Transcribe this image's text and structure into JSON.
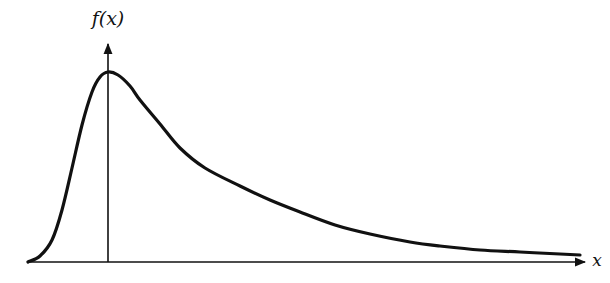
{
  "chart_data": {
    "type": "line",
    "title": "",
    "xlabel": "x",
    "ylabel": "f(x)",
    "grid": false,
    "legend": null,
    "series": [
      {
        "name": "f(x)",
        "points_px": [
          [
            28,
            262
          ],
          [
            40,
            256
          ],
          [
            52,
            240
          ],
          [
            62,
            210
          ],
          [
            72,
            168
          ],
          [
            82,
            125
          ],
          [
            92,
            92
          ],
          [
            100,
            77
          ],
          [
            108,
            72
          ],
          [
            118,
            75
          ],
          [
            130,
            86
          ],
          [
            140,
            100
          ],
          [
            160,
            124
          ],
          [
            180,
            148
          ],
          [
            205,
            168
          ],
          [
            240,
            186
          ],
          [
            270,
            200
          ],
          [
            300,
            212
          ],
          [
            335,
            225
          ],
          [
            370,
            234
          ],
          [
            410,
            242
          ],
          [
            440,
            246
          ],
          [
            480,
            250
          ],
          [
            520,
            252
          ],
          [
            560,
            254
          ],
          [
            580,
            255
          ]
        ]
      }
    ],
    "mode_x_px": 108,
    "axes": {
      "x_axis": {
        "from": [
          28,
          262
        ],
        "to": [
          585,
          262
        ],
        "arrow": true,
        "label": "x"
      },
      "y_axis": {
        "from": [
          108,
          262
        ],
        "to": [
          108,
          42
        ],
        "arrow": true,
        "label": "f(x)"
      }
    }
  },
  "labels": {
    "y_axis": "f(x)",
    "x_axis": "x"
  },
  "colors": {
    "ink": "#111111",
    "background": "#ffffff"
  }
}
